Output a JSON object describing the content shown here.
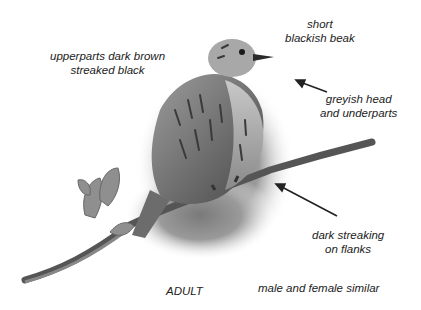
{
  "figure": {
    "labels": {
      "upperparts": {
        "line1": "upperparts dark brown",
        "line2": "streaked black"
      },
      "beak": {
        "line1": "short",
        "line2": "blackish beak"
      },
      "head": {
        "line1": "greyish head",
        "line2": "and underparts"
      },
      "flanks": {
        "line1": "dark streaking",
        "line2": "on flanks"
      },
      "age": "ADULT",
      "sex": "male and female similar"
    },
    "colors": {
      "background": "#ffffff",
      "text": "#222222",
      "arrow": "#222222"
    }
  }
}
